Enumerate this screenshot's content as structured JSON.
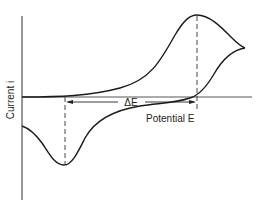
{
  "axes": {
    "y_label": "Current i",
    "x_label": "Potential E"
  },
  "annotations": {
    "peak_separation_label": "ΔE"
  },
  "colors": {
    "line": "#1a1a1a",
    "axis": "#333333",
    "background": "#ffffff"
  }
}
